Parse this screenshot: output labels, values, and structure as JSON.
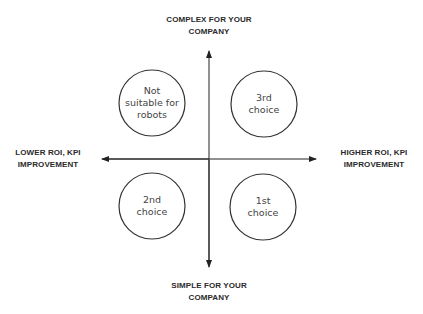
{
  "axes": {
    "top": {
      "line1": "COMPLEX FOR YOUR",
      "line2": "COMPANY"
    },
    "bottom": {
      "line1": "SIMPLE FOR YOUR",
      "line2": "COMPANY"
    },
    "left": {
      "line1": "LOWER ROI, KPI",
      "line2": "IMPROVEMENT"
    },
    "right": {
      "line1": "HIGHER ROI, KPI",
      "line2": "IMPROVEMENT"
    }
  },
  "quadrants": {
    "top_left": {
      "lines": [
        "Not",
        "suitable for",
        "robots"
      ]
    },
    "top_right": {
      "lines": [
        "3rd",
        "choice"
      ]
    },
    "bottom_left": {
      "lines": [
        "2nd",
        "choice"
      ]
    },
    "bottom_right": {
      "lines": [
        "1st",
        "choice"
      ]
    }
  },
  "colors": {
    "axis": "#222222",
    "circle_stroke": "#333333",
    "label_text": "#2a2a2a",
    "circle_text": "#444444"
  }
}
